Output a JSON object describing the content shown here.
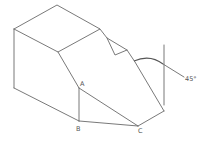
{
  "diagram": {
    "type": "isometric-technical-drawing",
    "line_color": "#6a6a6a",
    "labels": {
      "a": "A",
      "b": "B",
      "c": "C",
      "angle": "45°"
    },
    "vertices": {
      "top_back": [
        57,
        5
      ],
      "left_top": [
        14,
        29
      ],
      "front_top_left": [
        58,
        52
      ],
      "top_right": [
        100,
        29
      ],
      "notch_top": [
        107,
        38
      ],
      "notch_bottom": [
        115,
        55
      ],
      "notch_right": [
        127,
        50
      ],
      "slope_start": [
        135,
        62
      ],
      "right_bottom": [
        164,
        111
      ],
      "left_bottom": [
        14,
        88
      ],
      "A": [
        79,
        88
      ],
      "B": [
        79,
        121
      ],
      "C": [
        138,
        126
      ]
    },
    "angle_annotation": {
      "value": "45°",
      "reference_line_x": 164,
      "reference_line_y_range": [
        45,
        105
      ]
    }
  }
}
